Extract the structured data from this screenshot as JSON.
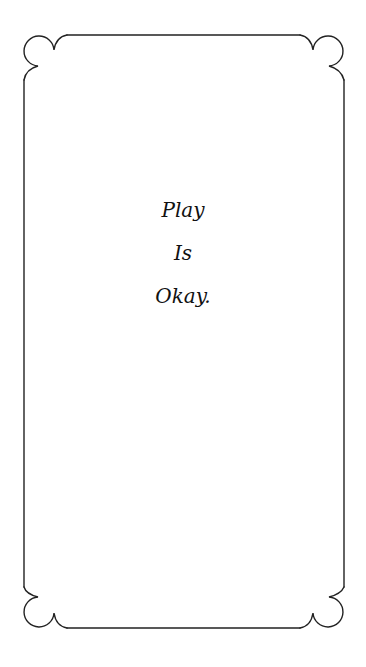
{
  "card": {
    "lines": [
      "Play",
      "Is",
      "Okay."
    ]
  },
  "colors": {
    "background": "#ffffff",
    "border": "#222222",
    "text": "#111111"
  },
  "icons": {
    "frame": "ornamental-scalloped-border"
  }
}
